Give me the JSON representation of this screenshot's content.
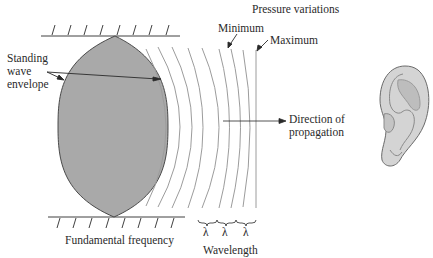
{
  "diagram": {
    "labels": {
      "pressure_variations": "Pressure variations",
      "minimum": "Minimum",
      "maximum": "Maximum",
      "standing_line1": "Standing",
      "standing_line2": "wave",
      "standing_line3": "envelope",
      "direction_line1": "Direction of",
      "direction_line2": "propagation",
      "fundamental": "Fundamental frequency",
      "wavelength": "Wavelength",
      "lambda1": "λ",
      "lambda2": "λ",
      "lambda3": "λ"
    },
    "colors": {
      "envelope_fill": "#a9a9a9",
      "envelope_stroke": "#3a3a3a",
      "wave_lines": "#9a9a9a",
      "ink": "#2a2a2a",
      "ear_fill": "#d4d4d4",
      "ear_shadow": "#b5b5b5"
    }
  }
}
